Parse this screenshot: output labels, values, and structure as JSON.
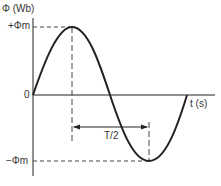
{
  "diagram": {
    "y_axis_label": "Φ (Wb)",
    "x_axis_label": "t (s)",
    "pos_peak_label": "+Φm",
    "neg_peak_label": "−Φm",
    "zero_label": "0",
    "half_period_label": "T/2",
    "curve": "sine wave, one full period starting at origin",
    "colors": {
      "line": "#222222",
      "dash": "#444444"
    }
  }
}
